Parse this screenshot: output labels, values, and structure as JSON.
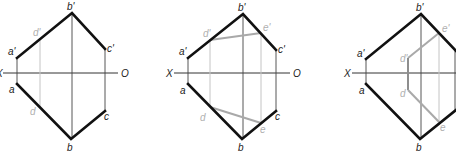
{
  "diagram": {
    "colors": {
      "edge": "#111111",
      "axis": "#333333",
      "projection_line": "#c4c4c4",
      "auxiliary_line": "#a9a9a9",
      "gray_label": "#b0b0b0"
    },
    "figures": [
      {
        "id": "figure-1",
        "axis_labels": {
          "x": "X",
          "o": "O"
        },
        "labels": {
          "a_prime": "a'",
          "b_prime": "b'",
          "c_prime": "c'",
          "d_prime": "d'",
          "a": "a",
          "b": "b",
          "c": "c",
          "d": "d"
        }
      },
      {
        "id": "figure-2",
        "axis_labels": {
          "x": "X",
          "o": "O"
        },
        "labels": {
          "a_prime": "a'",
          "b_prime": "b'",
          "c_prime": "c'",
          "d_prime": "d'",
          "e_prime": "e'",
          "a": "a",
          "b": "b",
          "c": "c",
          "d": "d",
          "e": "e"
        }
      },
      {
        "id": "figure-3",
        "axis_labels": {
          "x": "X"
        },
        "labels": {
          "a_prime": "a'",
          "b_prime": "b'",
          "d_prime": "d'",
          "e_prime": "e'",
          "a": "a",
          "b": "b",
          "d": "d",
          "e": "e"
        }
      }
    ]
  }
}
